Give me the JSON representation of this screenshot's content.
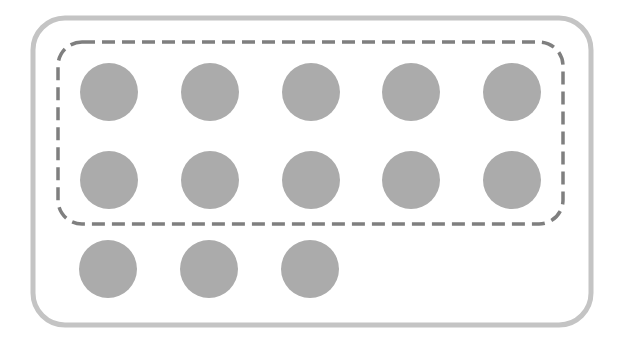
{
  "diagram": {
    "colors": {
      "background": "#ffffff",
      "outer_border": "#c4c4c4",
      "group_border": "#7f7f7f",
      "item_fill": "#ababab"
    },
    "outer_container": {
      "x": 33,
      "y": 18,
      "width": 558,
      "height": 307,
      "radius": 32,
      "stroke_width": 5
    },
    "dashed_group": {
      "x": 58,
      "y": 42,
      "width": 505,
      "height": 182,
      "radius": 24,
      "stroke_width": 3.5,
      "dash": "13 7",
      "item_count": 10
    },
    "item_radius": 29,
    "items": [
      {
        "row": 1,
        "col": 1,
        "cx": 109,
        "cy": 92,
        "in_group": true
      },
      {
        "row": 1,
        "col": 2,
        "cx": 210,
        "cy": 92,
        "in_group": true
      },
      {
        "row": 1,
        "col": 3,
        "cx": 311,
        "cy": 92,
        "in_group": true
      },
      {
        "row": 1,
        "col": 4,
        "cx": 411,
        "cy": 92,
        "in_group": true
      },
      {
        "row": 1,
        "col": 5,
        "cx": 512,
        "cy": 92,
        "in_group": true
      },
      {
        "row": 2,
        "col": 1,
        "cx": 109,
        "cy": 180,
        "in_group": true
      },
      {
        "row": 2,
        "col": 2,
        "cx": 210,
        "cy": 180,
        "in_group": true
      },
      {
        "row": 2,
        "col": 3,
        "cx": 311,
        "cy": 180,
        "in_group": true
      },
      {
        "row": 2,
        "col": 4,
        "cx": 411,
        "cy": 180,
        "in_group": true
      },
      {
        "row": 2,
        "col": 5,
        "cx": 512,
        "cy": 180,
        "in_group": true
      },
      {
        "row": 3,
        "col": 1,
        "cx": 108,
        "cy": 269,
        "in_group": false
      },
      {
        "row": 3,
        "col": 2,
        "cx": 209,
        "cy": 269,
        "in_group": false
      },
      {
        "row": 3,
        "col": 3,
        "cx": 310,
        "cy": 269,
        "in_group": false
      }
    ],
    "total_items": 13
  }
}
